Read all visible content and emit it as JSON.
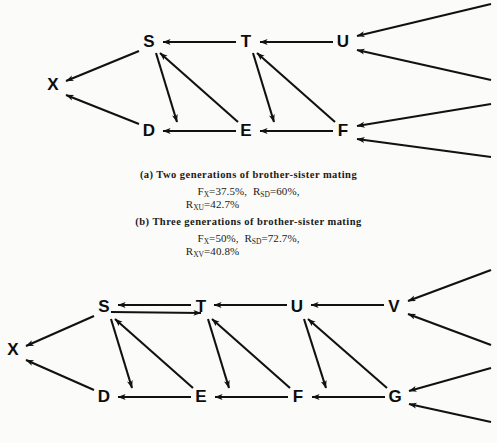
{
  "figure": {
    "background_color": "#fbfbf9",
    "ink_color": "#111111",
    "panels": [
      {
        "id": "panel-a",
        "caption": "(a) Two generations of brother-sister mating",
        "formulas": [
          {
            "line": "F_X=37.5%,  R_SD=60%,",
            "parts": [
              {
                "sym": "F",
                "sub": "X",
                "val": "=37.5%,"
              },
              {
                "sym": "R",
                "sub": "SD",
                "val": "=60%,"
              }
            ]
          },
          {
            "line": "R_XU=42.7%",
            "parts": [
              {
                "sym": "R",
                "sub": "XU",
                "val": "=42.7%"
              }
            ]
          }
        ],
        "nodes": [
          {
            "label": "X",
            "x": 53,
            "y": 85
          },
          {
            "label": "S",
            "x": 149,
            "y": 42
          },
          {
            "label": "T",
            "x": 246,
            "y": 42
          },
          {
            "label": "U",
            "x": 343,
            "y": 42
          },
          {
            "label": "D",
            "x": 149,
            "y": 131
          },
          {
            "label": "E",
            "x": 246,
            "y": 131
          },
          {
            "label": "F",
            "x": 343,
            "y": 131
          }
        ]
      },
      {
        "id": "panel-b",
        "caption": "(b) Three generations of brother-sister mating",
        "formulas": [
          {
            "line": "F_X=50%,  R_SD=72.7%,",
            "parts": [
              {
                "sym": "F",
                "sub": "X",
                "val": "=50%,"
              },
              {
                "sym": "R",
                "sub": "SD",
                "val": "=72.7%,"
              }
            ]
          },
          {
            "line": "R_XV=40.8%",
            "parts": [
              {
                "sym": "R",
                "sub": "XV",
                "val": "=40.8%"
              }
            ]
          }
        ],
        "nodes": [
          {
            "label": "X",
            "x": 13,
            "y": 350
          },
          {
            "label": "S",
            "x": 104,
            "y": 307
          },
          {
            "label": "T",
            "x": 201,
            "y": 307
          },
          {
            "label": "U",
            "x": 297,
            "y": 307
          },
          {
            "label": "V",
            "x": 394,
            "y": 307
          },
          {
            "label": "D",
            "x": 104,
            "y": 397
          },
          {
            "label": "E",
            "x": 201,
            "y": 397
          },
          {
            "label": "F",
            "x": 298,
            "y": 397
          },
          {
            "label": "G",
            "x": 395,
            "y": 397
          }
        ]
      }
    ]
  },
  "labels": {
    "a_caption": "(a) Two generations of brother-sister mating",
    "b_caption": "(b) Three generations of brother-sister mating",
    "a_f_sym": "F",
    "a_f_sub": "X",
    "a_f_val": "=37.5%,",
    "a_rsd_sym": "R",
    "a_rsd_sub": "SD",
    "a_rsd_val": "=60%,",
    "a_rxu_sym": "R",
    "a_rxu_sub": "XU",
    "a_rxu_val": "=42.7%",
    "b_f_sym": "F",
    "b_f_sub": "X",
    "b_f_val": "=50%,",
    "b_rsd_sym": "R",
    "b_rsd_sub": "SD",
    "b_rsd_val": "=72.7%,",
    "b_rxv_sym": "R",
    "b_rxv_sub": "XV",
    "b_rxv_val": "=40.8%",
    "n_a_X": "X",
    "n_a_S": "S",
    "n_a_T": "T",
    "n_a_U": "U",
    "n_a_D": "D",
    "n_a_E": "E",
    "n_a_F": "F",
    "n_b_X": "X",
    "n_b_S": "S",
    "n_b_T": "T",
    "n_b_U": "U",
    "n_b_V": "V",
    "n_b_D": "D",
    "n_b_E": "E",
    "n_b_F": "F",
    "n_b_G": "G"
  }
}
